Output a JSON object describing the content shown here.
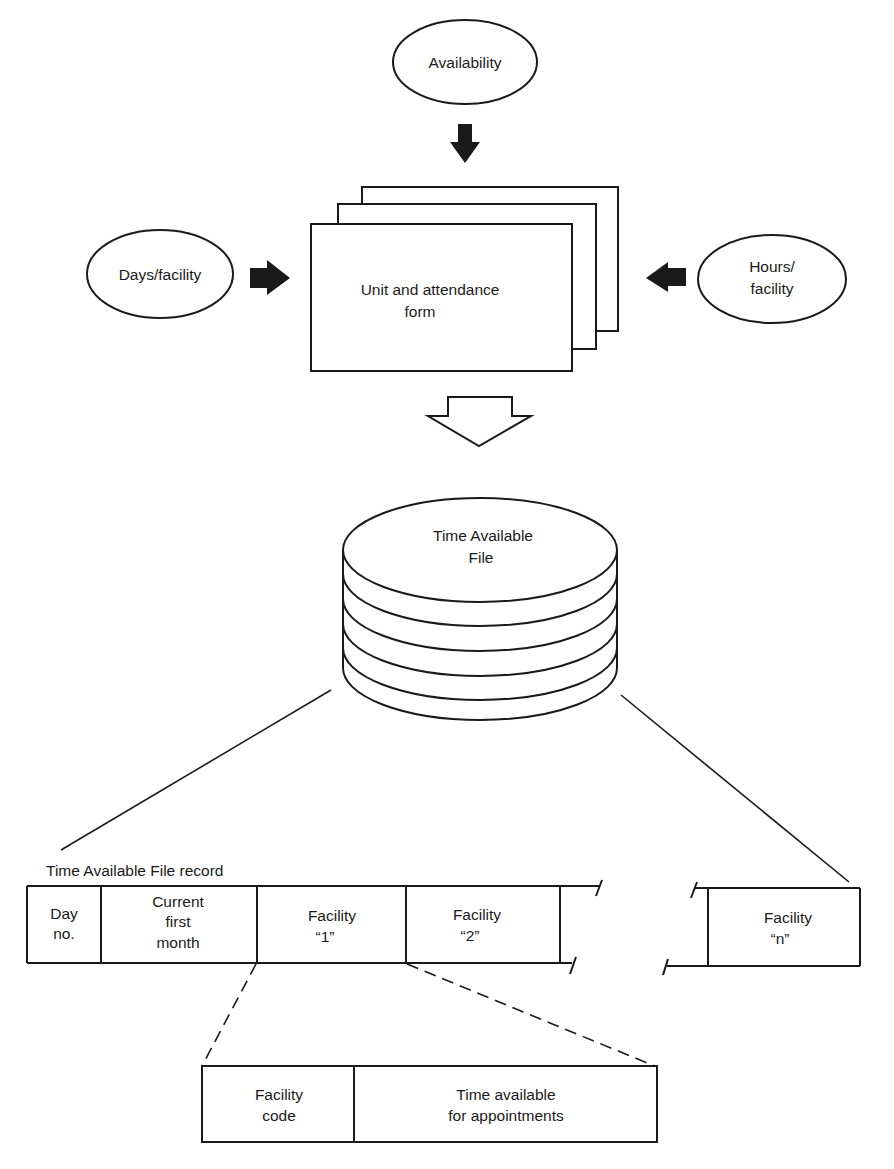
{
  "diagram": {
    "inputs": {
      "availability": "Availability",
      "days_facility": "Days/facility",
      "hours_facility": [
        "Hours/",
        "facility"
      ]
    },
    "form": {
      "lines": [
        "Unit and attendance",
        "form"
      ]
    },
    "file": {
      "lines": [
        "Time Available",
        "File"
      ]
    },
    "record": {
      "title": "Time Available File record",
      "fields": [
        {
          "lines": [
            "Day",
            "no."
          ]
        },
        {
          "lines": [
            "Current",
            "first",
            "month"
          ]
        },
        {
          "lines": [
            "Facility",
            "“1”"
          ]
        },
        {
          "lines": [
            "Facility",
            "“2”"
          ]
        },
        {
          "lines": [
            "Facility",
            "“n”"
          ]
        }
      ]
    },
    "facility_detail": {
      "fields": [
        {
          "lines": [
            "Facility",
            "code"
          ]
        },
        {
          "lines": [
            "Time available",
            "for appointments"
          ]
        }
      ]
    },
    "colors": {
      "ink": "#1a1a1a",
      "paper": "#ffffff"
    }
  }
}
